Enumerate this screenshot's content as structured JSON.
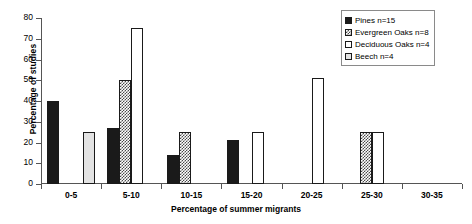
{
  "chart_data": {
    "type": "bar",
    "title": "",
    "xlabel": "Percentage of summer migrants",
    "ylabel": "Percentage of studies",
    "categories": [
      "0-5",
      "5-10",
      "10-15",
      "15-20",
      "20-25",
      "25-30",
      "30-35"
    ],
    "ylim": [
      0,
      80
    ],
    "yticks": [
      0,
      10,
      20,
      30,
      40,
      50,
      60,
      70,
      80
    ],
    "grid": false,
    "legend_position": "top-right",
    "series": [
      {
        "name": "Pines n=15",
        "fill": "solid-black",
        "color": "#1a1a1a",
        "values": [
          40,
          27,
          14,
          21,
          0,
          0,
          0
        ]
      },
      {
        "name": "Evergreen Oaks n=8",
        "fill": "checker-dark",
        "color": "#4a4a4a",
        "values": [
          0,
          50,
          25,
          0,
          0,
          25,
          0
        ]
      },
      {
        "name": "Deciduous Oaks n=4",
        "fill": "white",
        "color": "#ffffff",
        "values": [
          0,
          75,
          0,
          25,
          51,
          25,
          0
        ]
      },
      {
        "name": "Beech n=4",
        "fill": "light-gray",
        "color": "#e3e3e3",
        "values": [
          25,
          0,
          0,
          0,
          0,
          0,
          0
        ]
      }
    ]
  }
}
